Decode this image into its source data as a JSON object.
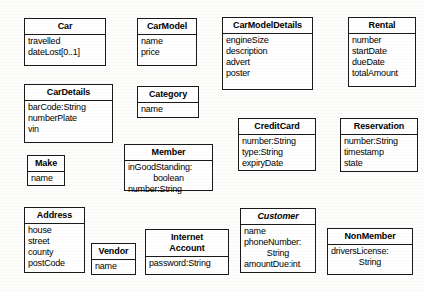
{
  "diagram": {
    "type": "uml-class-diagram",
    "background_color": "#fdfdfc",
    "line_color": "#1a1a1a",
    "text_color": "#000000",
    "classes": [
      {
        "name": "Car",
        "abstract": false,
        "attributes": [
          "travelled",
          "dateLost[0..1]"
        ],
        "x": 24,
        "y": 18,
        "w": 82,
        "h": 48
      },
      {
        "name": "CarModel",
        "abstract": false,
        "attributes": [
          "name",
          "price"
        ],
        "x": 137,
        "y": 18,
        "w": 60,
        "h": 48
      },
      {
        "name": "CarModelDetails",
        "abstract": false,
        "attributes": [
          "engineSize",
          "description",
          "advert",
          "poster"
        ],
        "x": 222,
        "y": 17,
        "w": 91,
        "h": 73
      },
      {
        "name": "Rental",
        "abstract": false,
        "attributes": [
          "number",
          "startDate",
          "dueDate",
          "totalAmount"
        ],
        "x": 348,
        "y": 17,
        "w": 68,
        "h": 70
      },
      {
        "name": "CarDetails",
        "abstract": false,
        "attributes": [
          "barCode:String",
          "numberPlate",
          "vin"
        ],
        "x": 24,
        "y": 84,
        "w": 89,
        "h": 59
      },
      {
        "name": "Category",
        "abstract": false,
        "attributes": [
          "name"
        ],
        "x": 137,
        "y": 86,
        "w": 62,
        "h": 32
      },
      {
        "name": "Member",
        "abstract": false,
        "attributes": [
          "inGoodStanding:",
          "boolean",
          "number:String"
        ],
        "continuation": [
          false,
          true,
          false
        ],
        "x": 124,
        "y": 144,
        "w": 89,
        "h": 47
      },
      {
        "name": "CreditCard",
        "abstract": false,
        "attributes": [
          "number:String",
          "type:String",
          "expiryDate"
        ],
        "x": 238,
        "y": 118,
        "w": 78,
        "h": 53
      },
      {
        "name": "Reservation",
        "abstract": false,
        "attributes": [
          "number:String",
          "timestamp",
          "state"
        ],
        "x": 340,
        "y": 118,
        "w": 78,
        "h": 54
      },
      {
        "name": "Make",
        "abstract": false,
        "attributes": [
          "name"
        ],
        "x": 27,
        "y": 155,
        "w": 38,
        "h": 31
      },
      {
        "name": "Address",
        "abstract": false,
        "attributes": [
          "house",
          "street",
          "county",
          "postCode"
        ],
        "x": 24,
        "y": 207,
        "w": 61,
        "h": 66
      },
      {
        "name": "Vendor",
        "abstract": false,
        "attributes": [
          "name"
        ],
        "x": 91,
        "y": 243,
        "w": 45,
        "h": 32
      },
      {
        "name": "Internet\nAccount",
        "abstract": false,
        "attributes": [
          "password:String"
        ],
        "x": 145,
        "y": 229,
        "w": 84,
        "h": 46
      },
      {
        "name": "Customer",
        "abstract": true,
        "attributes": [
          "name",
          "phoneNumber:",
          "String",
          "amountDue:int"
        ],
        "continuation": [
          false,
          false,
          true,
          false
        ],
        "x": 240,
        "y": 208,
        "w": 76,
        "h": 65
      },
      {
        "name": "NonMember",
        "abstract": false,
        "attributes": [
          "driversLicense:",
          "String"
        ],
        "continuation": [
          false,
          true
        ],
        "x": 327,
        "y": 228,
        "w": 86,
        "h": 47
      }
    ]
  }
}
